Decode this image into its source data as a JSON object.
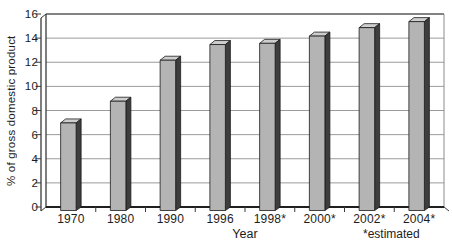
{
  "chart_data": {
    "type": "bar",
    "title": "",
    "categories": [
      "1970",
      "1980",
      "1990",
      "1996",
      "1998*",
      "2000*",
      "2002*",
      "2004*"
    ],
    "values": [
      7.3,
      9.1,
      12.5,
      13.8,
      13.9,
      14.5,
      15.2,
      15.7
    ],
    "xlabel": "Year",
    "ylabel": "% of gross domestic product",
    "footnote": "*estimated",
    "ylim": [
      0,
      16
    ],
    "yticks": [
      0,
      2,
      4,
      6,
      8,
      10,
      12,
      14,
      16
    ],
    "ytick_step": 2,
    "grid": true,
    "legend": "none",
    "bar_style": "3d-beveled",
    "colors": {
      "bar_front": "#b4b4b4",
      "bar_side": "#3d3d3d",
      "bar_top": "#cecece",
      "outline": "#1a1a1a",
      "gridline": "#9b9b9b",
      "axis": "#3a3a3a",
      "background": "#ffffff",
      "text": "#1c1c1c"
    }
  }
}
